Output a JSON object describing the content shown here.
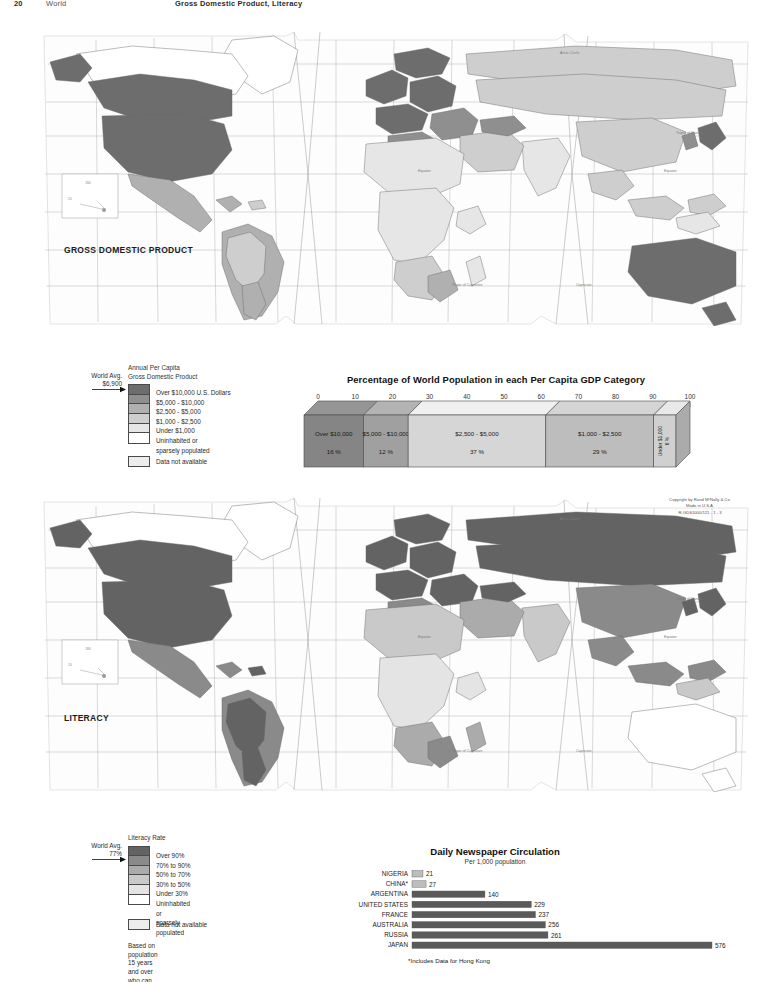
{
  "header": {
    "page_number": "20",
    "section": "World",
    "title": "Gross Domestic Product, Literacy"
  },
  "copyright": {
    "line1": "Copyright by Rand MᶜNally & Co.",
    "line2": "Made in U.S.A.",
    "line3": "R-GDS1000/121 - 1 - 3"
  },
  "maps": [
    {
      "id": "gdp",
      "caption": "GROSS\nDOMESTIC\nPRODUCT",
      "graticule_labels": {
        "arctic_circle": "Arctic Circle",
        "tropic_of_cancer": "Tropic of Cancer",
        "tropic_of_capricorn": "Tropic of Capricorn",
        "equator": "Equator",
        "antarctic_circle": "Antarctic Circle"
      }
    },
    {
      "id": "literacy",
      "caption": "LITERACY",
      "graticule_labels": {
        "arctic_circle": "Arctic Circle",
        "tropic_of_cancer": "Tropic of Cancer",
        "tropic_of_capricorn": "Tropic of Capricorn",
        "equator": "Equator",
        "antarctic_circle": "Antarctic Circle"
      }
    }
  ],
  "legend_gdp": {
    "title": "Annual Per Capita\nGross Domestic Product",
    "world_avg_label": "World Avg.\n$6,900",
    "classes": [
      {
        "label": "Over $10,000 U.S. Dollars",
        "color": "#6d6d6d"
      },
      {
        "label": "$5,000 - $10,000",
        "color": "#8f8f8f"
      },
      {
        "label": "$2,500 - $5,000",
        "color": "#b0b0b0"
      },
      {
        "label": "$1,000 - $2,500",
        "color": "#cecece"
      },
      {
        "label": "Under $1,000",
        "color": "#e6e6e6"
      },
      {
        "label": "Uninhabited or\nsparsely populated",
        "color": "#ffffff"
      }
    ],
    "not_available_label": "Data not available",
    "not_available_color": "#ededed"
  },
  "legend_literacy": {
    "title": "Literacy Rate",
    "world_avg_label": "World Avg.\n77%",
    "classes": [
      {
        "label": "Over 90%",
        "color": "#636363"
      },
      {
        "label": "70% to 90%",
        "color": "#8a8a8a"
      },
      {
        "label": "50% to 70%",
        "color": "#ababab"
      },
      {
        "label": "30% to 50%",
        "color": "#c9c9c9"
      },
      {
        "label": "Under 30%",
        "color": "#e4e4e4"
      },
      {
        "label": "Uninhabited or\nsparsely populated",
        "color": "#ffffff"
      }
    ],
    "not_available_label": "Data not available",
    "not_available_color": "#ededed",
    "note": "Based on population 15 years\nand over who can read and write."
  },
  "chart_data": [
    {
      "id": "gdp-population-bar",
      "type": "bar",
      "orientation": "horizontal-stacked",
      "title": "Percentage of World Population in each Per Capita GDP Category",
      "xlabel": "",
      "ylabel": "",
      "xlim": [
        0,
        100
      ],
      "grid": false,
      "axis_ticks": [
        "0",
        "10",
        "20",
        "30",
        "40",
        "50",
        "60",
        "70",
        "80",
        "90",
        "100"
      ],
      "categories": [
        "Over $10,000",
        "$5,000 - $10,000",
        "$2,500 - $5,000",
        "$1,000 - $2,500",
        "Under $1,000"
      ],
      "values": [
        16,
        12,
        37,
        29,
        6
      ],
      "value_labels": [
        "16 %",
        "12 %",
        "37 %",
        "29 %",
        "6 %"
      ],
      "colors": [
        "#858585",
        "#a0a0a0",
        "#d6d6d6",
        "#bdbdbd",
        "#d0d0d0"
      ]
    },
    {
      "id": "newspaper-circulation",
      "type": "bar",
      "orientation": "horizontal",
      "title": "Daily Newspaper Circulation",
      "subtitle": "Per 1,000 population",
      "xlabel": "",
      "ylabel": "",
      "xlim": [
        0,
        576
      ],
      "grid": false,
      "categories": [
        "NIGERIA",
        "CHINA*",
        "ARGENTINA",
        "UNITED STATES",
        "FRANCE",
        "AUSTRALIA",
        "RUSSIA",
        "JAPAN"
      ],
      "values": [
        21,
        27,
        140,
        229,
        237,
        256,
        261,
        576
      ],
      "value_labels": [
        "21",
        "27",
        "140",
        "229",
        "237",
        "256",
        "261",
        "576"
      ],
      "bar_color": "#5a5a5a",
      "footnote": "*Includes Data for Hong Kong"
    }
  ]
}
